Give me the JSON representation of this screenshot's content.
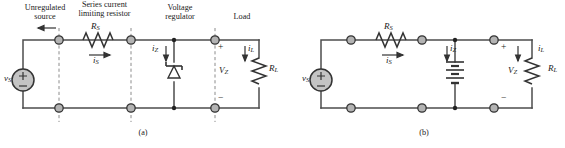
{
  "figure": {
    "type": "circuit-diagram",
    "width": 565,
    "height": 148,
    "background_color": "#ffffff",
    "wire_color": "#4d4d4d",
    "node_fill_color": "#b3b3b3",
    "node_stroke_color": "#333333",
    "dashed_color": "#808080",
    "source_fill_color": "#c4c4c4",
    "text_color": "#1a1a1a"
  },
  "panels": [
    {
      "id": "a",
      "label": "(a)",
      "headings": [
        {
          "name": "unregulated-source",
          "line1": "Unregulated",
          "line2": "source"
        },
        {
          "name": "series-current-limiting-resistor",
          "line1": "Series current",
          "line2": "limiting resistor"
        },
        {
          "name": "voltage-regulator",
          "line1": "Voltage",
          "line2": "regulator"
        },
        {
          "name": "load",
          "line1": "Load",
          "line2": ""
        }
      ],
      "components": {
        "source_label": "v",
        "source_sub": "S",
        "source_plus": "+",
        "source_minus": "−",
        "resistor_label": "R",
        "resistor_sub": "S",
        "series_current_label": "i",
        "series_current_sub": "S",
        "zener_current_label": "i",
        "zener_current_sub": "Z",
        "zener_voltage_label": "V",
        "zener_voltage_sub": "Z",
        "load_current_label": "i",
        "load_current_sub": "L",
        "load_resistor_label": "R",
        "load_resistor_sub": "L",
        "terminal_plus": "+",
        "terminal_minus": "−"
      },
      "regulator_device": "zener-diode"
    },
    {
      "id": "b",
      "label": "(b)",
      "headings": [],
      "components": {
        "source_label": "v",
        "source_sub": "S",
        "source_plus": "+",
        "source_minus": "−",
        "resistor_label": "R",
        "resistor_sub": "S",
        "series_current_label": "i",
        "series_current_sub": "S",
        "zener_current_label": "i",
        "zener_current_sub": "Z",
        "zener_voltage_label": "V",
        "zener_voltage_sub": "Z",
        "load_current_label": "i",
        "load_current_sub": "L",
        "load_resistor_label": "R",
        "load_resistor_sub": "L",
        "terminal_plus": "+",
        "terminal_minus": "−"
      },
      "regulator_device": "battery"
    }
  ]
}
